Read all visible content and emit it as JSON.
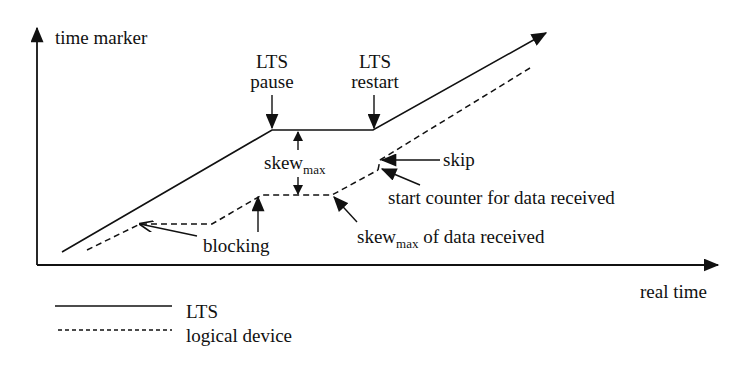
{
  "diagram": {
    "axes": {
      "y_label": "time marker",
      "x_label": "real time"
    },
    "annotations": {
      "lts_pause": {
        "line1": "LTS",
        "line2": "pause"
      },
      "lts_restart": {
        "line1": "LTS",
        "line2": "restart"
      },
      "skew_max": {
        "base": "skew",
        "sub": "max"
      },
      "skip": "skip",
      "start_counter": "start counter for data received",
      "skew_max_data": {
        "base": "skew",
        "sub": "max",
        "rest": " of data received"
      },
      "blocking": "blocking"
    },
    "legend": [
      {
        "style": "solid",
        "label": "LTS"
      },
      {
        "style": "dashed",
        "label": "logical device"
      }
    ],
    "colors": {
      "stroke": "#111111",
      "background": "#ffffff"
    }
  }
}
